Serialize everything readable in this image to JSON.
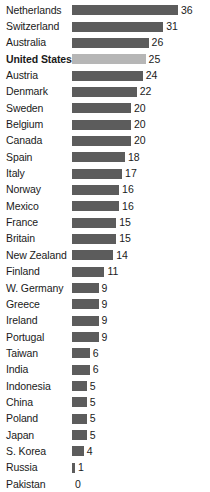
{
  "chart_data": {
    "type": "bar",
    "title": "",
    "subtitle": "",
    "xlabel": "",
    "ylabel": "",
    "orientation": "horizontal",
    "grid": false,
    "legend": false,
    "xlim": [
      0,
      36
    ],
    "highlight_category": "United States",
    "colors": {
      "bar": "#5c5c5c",
      "bar_highlight": "#b6b6b6",
      "background": "#ffffff",
      "text": "#1a1a1a"
    },
    "categories": [
      "Netherlands",
      "Switzerland",
      "Australia",
      "United States",
      "Austria",
      "Denmark",
      "Sweden",
      "Belgium",
      "Canada",
      "Spain",
      "Italy",
      "Norway",
      "Mexico",
      "France",
      "Britain",
      "New Zealand",
      "Finland",
      "W. Germany",
      "Greece",
      "Ireland",
      "Portugal",
      "Taiwan",
      "India",
      "Indonesia",
      "China",
      "Poland",
      "Japan",
      "S. Korea",
      "Russia",
      "Pakistan"
    ],
    "values": [
      36,
      31,
      26,
      25,
      24,
      22,
      20,
      20,
      20,
      18,
      17,
      16,
      16,
      15,
      15,
      14,
      11,
      9,
      9,
      9,
      9,
      6,
      6,
      5,
      5,
      5,
      5,
      4,
      1,
      0
    ]
  },
  "rows": [
    {
      "label": "Netherlands",
      "value": "36",
      "n": 36,
      "highlight": false
    },
    {
      "label": "Switzerland",
      "value": "31",
      "n": 31,
      "highlight": false
    },
    {
      "label": "Australia",
      "value": "26",
      "n": 26,
      "highlight": false
    },
    {
      "label": "United States",
      "value": "25",
      "n": 25,
      "highlight": true
    },
    {
      "label": "Austria",
      "value": "24",
      "n": 24,
      "highlight": false
    },
    {
      "label": "Denmark",
      "value": "22",
      "n": 22,
      "highlight": false
    },
    {
      "label": "Sweden",
      "value": "20",
      "n": 20,
      "highlight": false
    },
    {
      "label": "Belgium",
      "value": "20",
      "n": 20,
      "highlight": false
    },
    {
      "label": "Canada",
      "value": "20",
      "n": 20,
      "highlight": false
    },
    {
      "label": "Spain",
      "value": "18",
      "n": 18,
      "highlight": false
    },
    {
      "label": "Italy",
      "value": "17",
      "n": 17,
      "highlight": false
    },
    {
      "label": "Norway",
      "value": "16",
      "n": 16,
      "highlight": false
    },
    {
      "label": "Mexico",
      "value": "16",
      "n": 16,
      "highlight": false
    },
    {
      "label": "France",
      "value": "15",
      "n": 15,
      "highlight": false
    },
    {
      "label": "Britain",
      "value": "15",
      "n": 15,
      "highlight": false
    },
    {
      "label": "New Zealand",
      "value": "14",
      "n": 14,
      "highlight": false
    },
    {
      "label": "Finland",
      "value": "11",
      "n": 11,
      "highlight": false
    },
    {
      "label": "W. Germany",
      "value": "9",
      "n": 9,
      "highlight": false
    },
    {
      "label": "Greece",
      "value": "9",
      "n": 9,
      "highlight": false
    },
    {
      "label": "Ireland",
      "value": "9",
      "n": 9,
      "highlight": false
    },
    {
      "label": "Portugal",
      "value": "9",
      "n": 9,
      "highlight": false
    },
    {
      "label": "Taiwan",
      "value": "6",
      "n": 6,
      "highlight": false
    },
    {
      "label": "India",
      "value": "6",
      "n": 6,
      "highlight": false
    },
    {
      "label": "Indonesia",
      "value": "5",
      "n": 5,
      "highlight": false
    },
    {
      "label": "China",
      "value": "5",
      "n": 5,
      "highlight": false
    },
    {
      "label": "Poland",
      "value": "5",
      "n": 5,
      "highlight": false
    },
    {
      "label": "Japan",
      "value": "5",
      "n": 5,
      "highlight": false
    },
    {
      "label": "S. Korea",
      "value": "4",
      "n": 4,
      "highlight": false
    },
    {
      "label": "Russia",
      "value": "1",
      "n": 1,
      "highlight": false
    },
    {
      "label": "Pakistan",
      "value": "0",
      "n": 0,
      "highlight": false
    }
  ]
}
